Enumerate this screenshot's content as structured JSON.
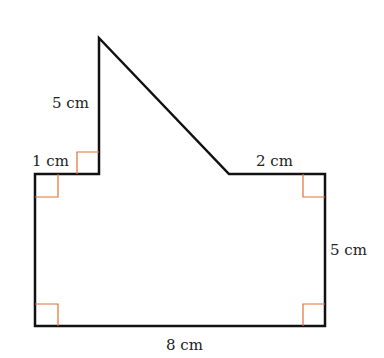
{
  "diagram": {
    "type": "composite-shape",
    "colors": {
      "outline": "#111111",
      "right_angle": "#e0703a",
      "text": "#222222"
    },
    "vertices": [
      [
        35,
        174
      ],
      [
        99,
        174
      ],
      [
        99,
        38
      ],
      [
        229,
        174
      ],
      [
        325,
        174
      ],
      [
        325,
        326
      ],
      [
        35,
        326
      ]
    ],
    "labels": {
      "left_vertical": "5 cm",
      "step_width": "1 cm",
      "top_right": "2 cm",
      "right_side": "5 cm",
      "bottom": "8 cm"
    },
    "right_angle_markers": 5
  }
}
